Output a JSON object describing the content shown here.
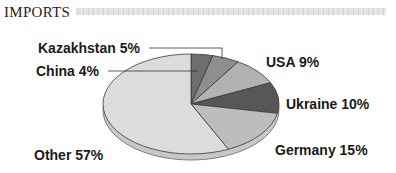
{
  "header": {
    "title": "IMPORTS"
  },
  "chart_data": {
    "type": "pie",
    "title": "IMPORTS",
    "style": "3d-exploded-none",
    "start_angle": "12 o'clock",
    "direction": "clockwise",
    "categories": [
      "China",
      "Kazakhstan",
      "USA",
      "Ukraine",
      "Germany",
      "Other"
    ],
    "values": [
      4,
      5,
      9,
      10,
      15,
      57
    ],
    "unit": "%",
    "labels": [
      {
        "name": "China",
        "text": "China 4%",
        "color": "#6e6e6e"
      },
      {
        "name": "Kazakhstan",
        "text": "Kazakhstan 5%",
        "color": "#8e8e8e"
      },
      {
        "name": "USA",
        "text": "USA 9%",
        "color": "#b2b2b2"
      },
      {
        "name": "Ukraine",
        "text": "Ukraine 10%",
        "color": "#575757"
      },
      {
        "name": "Germany",
        "text": "Germany 15%",
        "color": "#bdbdbd"
      },
      {
        "name": "Other",
        "text": "Other 57%",
        "color": "#dcdcdc"
      }
    ],
    "legend": "none (callout labels)"
  }
}
